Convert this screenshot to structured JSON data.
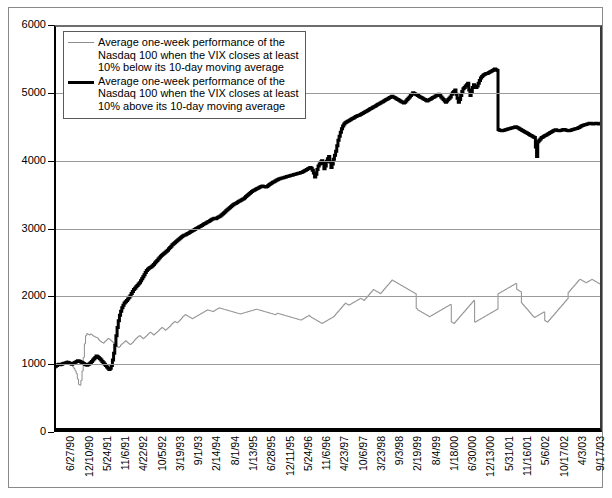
{
  "chart_data": {
    "type": "line",
    "title": "",
    "xlabel": "",
    "ylabel": "",
    "ylim": [
      0,
      6000
    ],
    "ytick_values": [
      0,
      1000,
      2000,
      3000,
      4000,
      5000,
      6000
    ],
    "ytick_labels": [
      "0",
      "1000",
      "2000",
      "3000",
      "4000",
      "5000",
      "6000"
    ],
    "grid": "horizontal gridlines at 1000,2000,3000,4000,5000",
    "legend_position": "upper-left inside plot",
    "xtick_labels": [
      "6/27/90",
      "12/10/90",
      "5/24/91",
      "11/6/91",
      "4/22/92",
      "10/5/92",
      "3/19/93",
      "9/1/93",
      "2/14/94",
      "8/1/94",
      "1/13/95",
      "6/28/95",
      "12/11/95",
      "5/24/96",
      "11/6/96",
      "4/23/97",
      "10/6/97",
      "3/23/98",
      "9/3/98",
      "2/19/99",
      "8/4/99",
      "1/18/00",
      "6/30/00",
      "12/13/00",
      "5/31/01",
      "11/16/01",
      "5/6/02",
      "10/17/02",
      "4/3/03",
      "9/17/03"
    ],
    "series": [
      {
        "name": "Average one-week performance of the Nasdaq 100 when the VIX closes at least 10% below its 10-day moving average",
        "color": "#8d8d8d",
        "width": 1,
        "values": [
          960,
          975,
          985,
          1000,
          1010,
          995,
          1005,
          1020,
          1030,
          1015,
          1040,
          1050,
          1035,
          1020,
          1005,
          990,
          960,
          935,
          900,
          860,
          780,
          700,
          690,
          760,
          900,
          1100,
          1300,
          1420,
          1450,
          1440,
          1430,
          1445,
          1435,
          1420,
          1410,
          1400,
          1395,
          1385,
          1360,
          1345,
          1330,
          1320,
          1310,
          1330,
          1345,
          1360,
          1380,
          1370,
          1355,
          1340,
          1325,
          1310,
          1290,
          1270,
          1255,
          1245,
          1260,
          1285,
          1300,
          1315,
          1330,
          1345,
          1330,
          1315,
          1300,
          1290,
          1305,
          1320,
          1340,
          1360,
          1380,
          1395,
          1410,
          1420,
          1405,
          1390,
          1375,
          1390,
          1405,
          1420,
          1440,
          1455,
          1470,
          1460,
          1445,
          1430,
          1445,
          1460,
          1475,
          1490,
          1510,
          1525,
          1540,
          1530,
          1515,
          1500,
          1515,
          1530,
          1545,
          1560,
          1580,
          1600,
          1615,
          1630,
          1620,
          1610,
          1625,
          1640,
          1660,
          1680,
          1700,
          1715,
          1730,
          1720,
          1710,
          1700,
          1690,
          1680,
          1670,
          1680,
          1690,
          1700,
          1710,
          1720,
          1730,
          1740,
          1750,
          1760,
          1770,
          1780,
          1790,
          1800,
          1795,
          1790,
          1785,
          1780,
          1775,
          1790,
          1800,
          1810,
          1820,
          1830,
          1825,
          1820,
          1815,
          1810,
          1805,
          1800,
          1795,
          1790,
          1785,
          1780,
          1775,
          1770,
          1765,
          1760,
          1755,
          1750,
          1745,
          1740,
          1745,
          1750,
          1755,
          1760,
          1765,
          1770,
          1775,
          1780,
          1785,
          1790,
          1795,
          1800,
          1805,
          1810,
          1805,
          1800,
          1795,
          1790,
          1785,
          1780,
          1775,
          1770,
          1765,
          1760,
          1755,
          1750,
          1745,
          1740,
          1735,
          1730,
          1740,
          1750,
          1745,
          1740,
          1735,
          1730,
          1725,
          1720,
          1715,
          1710,
          1705,
          1700,
          1695,
          1690,
          1685,
          1680,
          1675,
          1670,
          1665,
          1660,
          1655,
          1650,
          1660,
          1670,
          1680,
          1690,
          1700,
          1710,
          1720,
          1700,
          1690,
          1680,
          1670,
          1660,
          1650,
          1640,
          1630,
          1620,
          1610,
          1600,
          1610,
          1620,
          1630,
          1640,
          1650,
          1660,
          1670,
          1680,
          1690,
          1700,
          1720,
          1740,
          1760,
          1780,
          1800,
          1820,
          1840,
          1860,
          1880,
          1900,
          1890,
          1880,
          1870,
          1880,
          1890,
          1900,
          1910,
          1920,
          1930,
          1940,
          1950,
          1960,
          1970,
          1960,
          1950,
          1940,
          1960,
          1980,
          2000,
          2020,
          2040,
          2060,
          2080,
          2100,
          2090,
          2080,
          2070,
          2060,
          2050,
          2040,
          2060,
          2080,
          2100,
          2120,
          2140,
          2160,
          2180,
          2200,
          2220,
          2240,
          2230,
          2220,
          2210,
          2200,
          2190,
          2180,
          2170,
          2160,
          2150,
          2140,
          2130,
          2120,
          2110,
          2100,
          2090,
          2080,
          2070,
          2060,
          2050,
          2040,
          1820,
          1800,
          1790,
          1780,
          1770,
          1760,
          1750,
          1740,
          1730,
          1720,
          1710,
          1700,
          1710,
          1720,
          1730,
          1740,
          1750,
          1760,
          1770,
          1780,
          1790,
          1800,
          1810,
          1820,
          1830,
          1840,
          1850,
          1860,
          1870,
          1880,
          1620,
          1610,
          1600,
          1620,
          1640,
          1660,
          1680,
          1700,
          1720,
          1740,
          1760,
          1780,
          1800,
          1820,
          1840,
          1860,
          1880,
          1900,
          1920,
          1940,
          1620,
          1630,
          1640,
          1650,
          1660,
          1670,
          1680,
          1690,
          1700,
          1710,
          1720,
          1730,
          1740,
          1750,
          1760,
          1770,
          1780,
          1790,
          1800,
          1810,
          2040,
          2050,
          2060,
          2070,
          2080,
          2090,
          2100,
          2110,
          2120,
          2130,
          2140,
          2150,
          2160,
          2170,
          2180,
          2190,
          2100,
          2090,
          2080,
          2070,
          1900,
          1880,
          1860,
          1840,
          1820,
          1800,
          1780,
          1760,
          1740,
          1720,
          1700,
          1690,
          1700,
          1710,
          1720,
          1730,
          1740,
          1750,
          1760,
          1770,
          1640,
          1630,
          1620,
          1640,
          1660,
          1680,
          1700,
          1720,
          1740,
          1760,
          1780,
          1800,
          1820,
          1840,
          1860,
          1880,
          1900,
          1920,
          1940,
          1960,
          2060,
          2080,
          2100,
          2120,
          2140,
          2160,
          2180,
          2200,
          2220,
          2240,
          2250,
          2240,
          2230,
          2220,
          2210,
          2200,
          2210,
          2220,
          2230,
          2240,
          2250,
          2240,
          2230,
          2220,
          2210,
          2200,
          2190,
          2180,
          2170,
          2160
        ]
      },
      {
        "name": "Average one-week performance of the Nasdaq 100 when the VIX closes at least 10% above its 10-day moving average",
        "color": "#000000",
        "width": 3,
        "values": [
          960,
          970,
          980,
          990,
          1000,
          990,
          995,
          1005,
          1015,
          1010,
          1020,
          1030,
          1025,
          1015,
          1005,
          1000,
          1010,
          1020,
          1030,
          1040,
          1050,
          1045,
          1040,
          1030,
          1020,
          1010,
          1000,
          990,
          985,
          995,
          1005,
          1020,
          1040,
          1060,
          1080,
          1100,
          1120,
          1110,
          1095,
          1080,
          1060,
          1040,
          1020,
          1000,
          980,
          960,
          940,
          920,
          940,
          980,
          1060,
          1160,
          1280,
          1420,
          1540,
          1640,
          1720,
          1780,
          1830,
          1870,
          1900,
          1920,
          1940,
          1960,
          1985,
          2010,
          2040,
          2070,
          2100,
          2120,
          2140,
          2160,
          2180,
          2200,
          2230,
          2260,
          2290,
          2320,
          2350,
          2380,
          2400,
          2415,
          2425,
          2435,
          2450,
          2470,
          2490,
          2510,
          2530,
          2550,
          2570,
          2590,
          2605,
          2620,
          2635,
          2650,
          2665,
          2680,
          2700,
          2720,
          2740,
          2760,
          2775,
          2790,
          2805,
          2820,
          2835,
          2850,
          2865,
          2880,
          2890,
          2900,
          2905,
          2915,
          2925,
          2935,
          2945,
          2955,
          2965,
          2975,
          2985,
          2995,
          3005,
          3015,
          3025,
          3035,
          3045,
          3055,
          3065,
          3075,
          3085,
          3095,
          3105,
          3115,
          3125,
          3135,
          3145,
          3150,
          3145,
          3155,
          3165,
          3175,
          3185,
          3200,
          3215,
          3230,
          3245,
          3260,
          3275,
          3290,
          3305,
          3320,
          3335,
          3350,
          3360,
          3370,
          3380,
          3390,
          3400,
          3410,
          3420,
          3430,
          3440,
          3455,
          3470,
          3485,
          3500,
          3515,
          3530,
          3545,
          3555,
          3565,
          3575,
          3585,
          3595,
          3600,
          3610,
          3620,
          3625,
          3620,
          3615,
          3610,
          3620,
          3635,
          3650,
          3660,
          3670,
          3680,
          3690,
          3700,
          3710,
          3720,
          3730,
          3735,
          3740,
          3745,
          3750,
          3755,
          3760,
          3765,
          3770,
          3775,
          3780,
          3785,
          3790,
          3795,
          3800,
          3805,
          3810,
          3815,
          3820,
          3825,
          3830,
          3840,
          3850,
          3860,
          3870,
          3880,
          3890,
          3900,
          3890,
          3860,
          3820,
          3760,
          3800,
          3870,
          3920,
          3950,
          3980,
          4000,
          3960,
          3880,
          3920,
          3990,
          4030,
          4060,
          3980,
          3900,
          3950,
          4020,
          4080,
          4140,
          4220,
          4300,
          4360,
          4420,
          4470,
          4510,
          4540,
          4560,
          4570,
          4580,
          4590,
          4600,
          4610,
          4620,
          4630,
          4640,
          4650,
          4660,
          4665,
          4670,
          4680,
          4690,
          4700,
          4710,
          4720,
          4730,
          4740,
          4750,
          4760,
          4770,
          4780,
          4790,
          4800,
          4810,
          4820,
          4830,
          4840,
          4850,
          4860,
          4870,
          4880,
          4890,
          4900,
          4910,
          4920,
          4930,
          4940,
          4950,
          4940,
          4930,
          4920,
          4910,
          4900,
          4890,
          4880,
          4870,
          4860,
          4850,
          4860,
          4880,
          4900,
          4920,
          4940,
          4960,
          4980,
          5000,
          4990,
          4980,
          4970,
          4960,
          4950,
          4940,
          4930,
          4920,
          4910,
          4900,
          4890,
          4880,
          4890,
          4900,
          4910,
          4920,
          4930,
          4940,
          4950,
          4960,
          4970,
          4980,
          4960,
          4940,
          4920,
          4900,
          4880,
          4860,
          4880,
          4900,
          4920,
          4940,
          4980,
          5000,
          5020,
          5040,
          4980,
          4920,
          4860,
          4900,
          4960,
          5020,
          5060,
          5080,
          5100,
          5120,
          5140,
          5040,
          4960,
          5020,
          5080,
          5120,
          5100,
          5080,
          5100,
          5140,
          5180,
          5220,
          5240,
          5260,
          5270,
          5280,
          5285,
          5290,
          5300,
          5310,
          5320,
          5330,
          5340,
          5350,
          5340,
          5330,
          4460,
          4450,
          4445,
          4440,
          4445,
          4450,
          4455,
          4460,
          4465,
          4470,
          4475,
          4480,
          4485,
          4490,
          4495,
          4500,
          4490,
          4480,
          4470,
          4460,
          4450,
          4440,
          4430,
          4420,
          4410,
          4400,
          4390,
          4380,
          4370,
          4360,
          4350,
          4340,
          4200,
          4060,
          4280,
          4300,
          4320,
          4340,
          4350,
          4360,
          4370,
          4380,
          4390,
          4400,
          4410,
          4420,
          4430,
          4440,
          4450,
          4455,
          4450,
          4445,
          4440,
          4445,
          4450,
          4455,
          4460,
          4455,
          4450,
          4445,
          4440,
          4445,
          4450,
          4455,
          4460,
          4465,
          4470,
          4475,
          4480,
          4490,
          4500,
          4510,
          4520,
          4525,
          4530,
          4535,
          4540,
          4545,
          4550,
          4550,
          4545,
          4540,
          4545,
          4550,
          4550,
          4545,
          4540,
          4545,
          4550,
          4550
        ]
      }
    ]
  },
  "legend": {
    "entries": [
      {
        "swatch": "thin-gray-line",
        "label": "Average one-week performance of the\nNasdaq 100 when the VIX closes at least\n10% below its 10-day moving average"
      },
      {
        "swatch": "thick-black-line",
        "label": "Average one-week performance of the\nNasdaq 100 when the VIX closes at least\n10% above its 10-day moving average"
      }
    ]
  },
  "colors": {
    "below_series": "#8d8d8d",
    "above_series": "#000000",
    "gridline": "#9a9a9a",
    "axis": "#000000",
    "background": "#ffffff"
  }
}
